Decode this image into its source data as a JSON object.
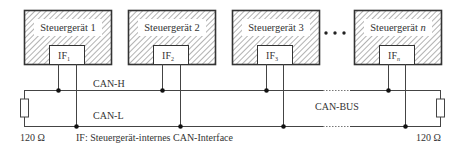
{
  "diagram": {
    "ecus": [
      {
        "label": "Steuergerät 1",
        "interface": "IF",
        "interface_sub": "1"
      },
      {
        "label": "Steuergerät 2",
        "interface": "IF",
        "interface_sub": "2"
      },
      {
        "label": "Steuergerät 3",
        "interface": "IF",
        "interface_sub": "3"
      },
      {
        "label": "Steuergerät ",
        "label_italic": "n",
        "interface": "IF",
        "interface_sub": "n"
      }
    ],
    "ellipsis": "• • •",
    "bus": {
      "high_label": "CAN-H",
      "low_label": "CAN-L",
      "bus_label": "CAN-BUS"
    },
    "terminators": {
      "left": "120 Ω",
      "right": "120 Ω"
    },
    "legend": "IF: Steuergerät-internes CAN-Interface",
    "colors": {
      "line": "#444444",
      "frame": "#333333",
      "hatch": "#555555",
      "junction": "#111111"
    }
  }
}
